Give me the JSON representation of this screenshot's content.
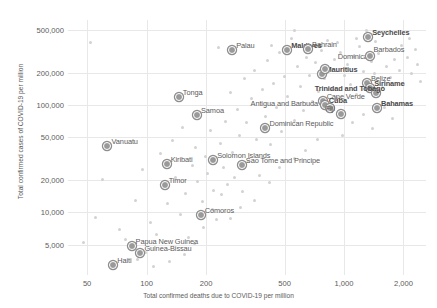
{
  "chart_data": {
    "type": "scatter",
    "title": "",
    "xlabel": "Total confirmed deaths due to COVID-19 per million",
    "ylabel": "Total confirmed cases of COVID-19 per million",
    "xscale": "log",
    "yscale": "log",
    "xlim": [
      40,
      2600
    ],
    "ylim": [
      2600,
      620000
    ],
    "grid": true,
    "legend": "none",
    "xticks": [
      {
        "value": 50,
        "label": "50"
      },
      {
        "value": 100,
        "label": "100"
      },
      {
        "value": 200,
        "label": "200"
      },
      {
        "value": 500,
        "label": "500"
      },
      {
        "value": 1000,
        "label": "1,000"
      },
      {
        "value": 2000,
        "label": "2,000"
      }
    ],
    "yticks": [
      {
        "value": 5000,
        "label": "5,000"
      },
      {
        "value": 10000,
        "label": "10,000"
      },
      {
        "value": 20000,
        "label": "20,000"
      },
      {
        "value": 50000,
        "label": "50,000"
      },
      {
        "value": 100000,
        "label": "100,000"
      },
      {
        "value": 200000,
        "label": "200,000"
      },
      {
        "value": 500000,
        "label": "500,000"
      }
    ],
    "labeled_points": [
      {
        "name": "Vanuatu",
        "x": 62,
        "y": 42000,
        "lx": 6,
        "ly": -7,
        "bold": false
      },
      {
        "name": "Haiti",
        "x": 67,
        "y": 3300,
        "lx": 5,
        "ly": -7,
        "bold": false
      },
      {
        "name": "Papua New Guinea",
        "x": 83,
        "y": 4900,
        "lx": 5,
        "ly": -7,
        "bold": false
      },
      {
        "name": "Guinea-Bissau",
        "x": 92,
        "y": 4300,
        "lx": 5,
        "ly": -7,
        "bold": false
      },
      {
        "name": "Timor",
        "x": 122,
        "y": 18500,
        "lx": 5,
        "ly": -7,
        "bold": false
      },
      {
        "name": "Kiribati",
        "x": 125,
        "y": 28500,
        "lx": 5,
        "ly": -7,
        "bold": false
      },
      {
        "name": "Tonga",
        "x": 144,
        "y": 120000,
        "lx": 5,
        "ly": -7,
        "bold": false
      },
      {
        "name": "Samoa",
        "x": 178,
        "y": 83000,
        "lx": 5,
        "ly": -7,
        "bold": false
      },
      {
        "name": "Comoros",
        "x": 186,
        "y": 9700,
        "lx": 5,
        "ly": -7,
        "bold": false
      },
      {
        "name": "Solomon Islands",
        "x": 215,
        "y": 31500,
        "lx": 5,
        "ly": -7,
        "bold": false
      },
      {
        "name": "Sao Tome and Principe",
        "x": 300,
        "y": 28000,
        "lx": 5,
        "ly": -7,
        "bold": false
      },
      {
        "name": "Palau",
        "x": 268,
        "y": 335000,
        "lx": 5,
        "ly": -7,
        "bold": false
      },
      {
        "name": "Dominican Republic",
        "x": 395,
        "y": 62000,
        "lx": 5,
        "ly": -7,
        "bold": false
      },
      {
        "name": "Maldives",
        "x": 510,
        "y": 330000,
        "lx": 5,
        "ly": -7,
        "bold": true
      },
      {
        "name": "Bahrain",
        "x": 650,
        "y": 340000,
        "lx": 5,
        "ly": -7,
        "bold": false
      },
      {
        "name": "Mauritius",
        "x": 760,
        "y": 198000,
        "lx": 5,
        "ly": -7,
        "bold": true
      },
      {
        "name": "Dominica",
        "x": 790,
        "y": 222000,
        "lx": 14,
        "ly": -15,
        "bold": false
      },
      {
        "name": "Cape Verde",
        "x": 770,
        "y": 112000,
        "lx": 5,
        "ly": -7,
        "bold": false
      },
      {
        "name": "Cuba",
        "x": 790,
        "y": 103000,
        "lx": 5,
        "ly": -7,
        "bold": true
      },
      {
        "name": "Antigua and Barbuda",
        "x": 835,
        "y": 96000,
        "lx": -78,
        "ly": -7,
        "bold": false
      },
      {
        "name": "Fiji",
        "x": 950,
        "y": 85000,
        "lx": -14,
        "ly": -8,
        "bold": false
      },
      {
        "name": "Seychelles",
        "x": 1310,
        "y": 440000,
        "lx": 5,
        "ly": -7,
        "bold": true
      },
      {
        "name": "Barbados",
        "x": 1330,
        "y": 290000,
        "lx": 5,
        "ly": -9,
        "bold": false
      },
      {
        "name": "Belize",
        "x": 1290,
        "y": 165000,
        "lx": 5,
        "ly": -7,
        "bold": false
      },
      {
        "name": "Siriname",
        "x": 1340,
        "y": 148000,
        "lx": 5,
        "ly": -7,
        "bold": true
      },
      {
        "name": "Trinidad and Tobago",
        "x": 1430,
        "y": 133000,
        "lx": -60,
        "ly": -7,
        "bold": true
      },
      {
        "name": "Bahamas",
        "x": 1450,
        "y": 95000,
        "lx": 5,
        "ly": -7,
        "bold": true
      }
    ],
    "background_points": [
      {
        "x": 52,
        "y": 380000
      },
      {
        "x": 55,
        "y": 9000
      },
      {
        "x": 48,
        "y": 5200
      },
      {
        "x": 60,
        "y": 20000
      },
      {
        "x": 73,
        "y": 6900
      },
      {
        "x": 78,
        "y": 5600
      },
      {
        "x": 88,
        "y": 13000
      },
      {
        "x": 95,
        "y": 25000
      },
      {
        "x": 99,
        "y": 4200
      },
      {
        "x": 105,
        "y": 8000
      },
      {
        "x": 112,
        "y": 6200
      },
      {
        "x": 118,
        "y": 35000
      },
      {
        "x": 128,
        "y": 12000
      },
      {
        "x": 135,
        "y": 47000
      },
      {
        "x": 140,
        "y": 21000
      },
      {
        "x": 148,
        "y": 9500
      },
      {
        "x": 152,
        "y": 62000
      },
      {
        "x": 158,
        "y": 15000
      },
      {
        "x": 163,
        "y": 5800
      },
      {
        "x": 170,
        "y": 27000
      },
      {
        "x": 176,
        "y": 40000
      },
      {
        "x": 182,
        "y": 19500
      },
      {
        "x": 192,
        "y": 12500
      },
      {
        "x": 198,
        "y": 33000
      },
      {
        "x": 203,
        "y": 23000
      },
      {
        "x": 210,
        "y": 58000
      },
      {
        "x": 218,
        "y": 16000
      },
      {
        "x": 226,
        "y": 8600
      },
      {
        "x": 232,
        "y": 340000
      },
      {
        "x": 238,
        "y": 44000
      },
      {
        "x": 245,
        "y": 26000
      },
      {
        "x": 252,
        "y": 70000
      },
      {
        "x": 258,
        "y": 18000
      },
      {
        "x": 265,
        "y": 130000
      },
      {
        "x": 272,
        "y": 36000
      },
      {
        "x": 280,
        "y": 21000
      },
      {
        "x": 288,
        "y": 90000
      },
      {
        "x": 296,
        "y": 52000
      },
      {
        "x": 305,
        "y": 15500
      },
      {
        "x": 312,
        "y": 175000
      },
      {
        "x": 322,
        "y": 68000
      },
      {
        "x": 330,
        "y": 30000
      },
      {
        "x": 340,
        "y": 115000
      },
      {
        "x": 350,
        "y": 210000
      },
      {
        "x": 360,
        "y": 48000
      },
      {
        "x": 372,
        "y": 22000
      },
      {
        "x": 385,
        "y": 140000
      },
      {
        "x": 398,
        "y": 78000
      },
      {
        "x": 410,
        "y": 260000
      },
      {
        "x": 425,
        "y": 43000
      },
      {
        "x": 440,
        "y": 160000
      },
      {
        "x": 455,
        "y": 95000
      },
      {
        "x": 470,
        "y": 310000
      },
      {
        "x": 485,
        "y": 57000
      },
      {
        "x": 500,
        "y": 185000
      },
      {
        "x": 520,
        "y": 120000
      },
      {
        "x": 540,
        "y": 420000
      },
      {
        "x": 560,
        "y": 72000
      },
      {
        "x": 580,
        "y": 230000
      },
      {
        "x": 600,
        "y": 150000
      },
      {
        "x": 620,
        "y": 88000
      },
      {
        "x": 645,
        "y": 280000
      },
      {
        "x": 665,
        "y": 190000
      },
      {
        "x": 690,
        "y": 108000
      },
      {
        "x": 715,
        "y": 250000
      },
      {
        "x": 740,
        "y": 135000
      },
      {
        "x": 765,
        "y": 320000
      },
      {
        "x": 800,
        "y": 175000
      },
      {
        "x": 830,
        "y": 205000
      },
      {
        "x": 860,
        "y": 140000
      },
      {
        "x": 890,
        "y": 265000
      },
      {
        "x": 920,
        "y": 118000
      },
      {
        "x": 960,
        "y": 310000
      },
      {
        "x": 1000,
        "y": 190000
      },
      {
        "x": 1040,
        "y": 240000
      },
      {
        "x": 1080,
        "y": 155000
      },
      {
        "x": 1120,
        "y": 285000
      },
      {
        "x": 1160,
        "y": 125000
      },
      {
        "x": 1200,
        "y": 350000
      },
      {
        "x": 1250,
        "y": 205000
      },
      {
        "x": 1300,
        "y": 160000
      },
      {
        "x": 1380,
        "y": 255000
      },
      {
        "x": 1420,
        "y": 195000
      },
      {
        "x": 1500,
        "y": 300000
      },
      {
        "x": 1560,
        "y": 145000
      },
      {
        "x": 1640,
        "y": 230000
      },
      {
        "x": 1720,
        "y": 180000
      },
      {
        "x": 1800,
        "y": 265000
      },
      {
        "x": 1900,
        "y": 210000
      },
      {
        "x": 2000,
        "y": 155000
      },
      {
        "x": 2100,
        "y": 280000
      },
      {
        "x": 2200,
        "y": 195000
      },
      {
        "x": 2350,
        "y": 240000
      },
      {
        "x": 2450,
        "y": 165000
      },
      {
        "x": 2300,
        "y": 330000
      },
      {
        "x": 1950,
        "y": 360000
      },
      {
        "x": 1100,
        "y": 68000
      },
      {
        "x": 1250,
        "y": 82000
      },
      {
        "x": 1400,
        "y": 60000
      },
      {
        "x": 980,
        "y": 52000
      },
      {
        "x": 1600,
        "y": 95000
      },
      {
        "x": 1750,
        "y": 75000
      },
      {
        "x": 730,
        "y": 48000
      },
      {
        "x": 640,
        "y": 38000
      },
      {
        "x": 560,
        "y": 32000
      },
      {
        "x": 470,
        "y": 26000
      },
      {
        "x": 420,
        "y": 19000
      },
      {
        "x": 350,
        "y": 13000
      },
      {
        "x": 300,
        "y": 11000
      },
      {
        "x": 265,
        "y": 8800
      },
      {
        "x": 240,
        "y": 14500
      },
      {
        "x": 215,
        "y": 10500
      },
      {
        "x": 195,
        "y": 7200
      },
      {
        "x": 175,
        "y": 5100
      },
      {
        "x": 155,
        "y": 4000
      },
      {
        "x": 130,
        "y": 3500
      },
      {
        "x": 108,
        "y": 3100
      },
      {
        "x": 90,
        "y": 3600
      },
      {
        "x": 1150,
        "y": 420000
      },
      {
        "x": 820,
        "y": 400000
      },
      {
        "x": 930,
        "y": 380000
      },
      {
        "x": 1450,
        "y": 390000
      },
      {
        "x": 430,
        "y": 360000
      },
      {
        "x": 2150,
        "y": 420000
      },
      {
        "x": 1300,
        "y": 490000
      },
      {
        "x": 560,
        "y": 495000
      }
    ]
  }
}
